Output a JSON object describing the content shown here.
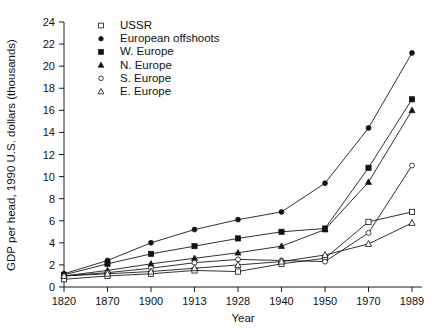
{
  "chart_data": {
    "type": "line",
    "title": "",
    "xlabel": "Year",
    "ylabel": "GDP per head, 1990 U.S. dollars (thousands)",
    "categories": [
      "1820",
      "1870",
      "1900",
      "1913",
      "1928",
      "1940",
      "1950",
      "1970",
      "1989"
    ],
    "x": [
      1820,
      1870,
      1900,
      1913,
      1928,
      1940,
      1950,
      1970,
      1989
    ],
    "xlim": [
      0,
      8
    ],
    "ylim": [
      0,
      24
    ],
    "yticks": [
      0,
      2,
      4,
      6,
      8,
      10,
      12,
      14,
      16,
      18,
      20,
      22,
      24
    ],
    "grid": false,
    "legend_position": "top-left-inside",
    "series": [
      {
        "name": "USSR",
        "marker": "open-square",
        "values": [
          0.7,
          1.0,
          1.2,
          1.5,
          1.4,
          2.1,
          2.6,
          5.9,
          6.8
        ]
      },
      {
        "name": "European offshoots",
        "marker": "filled-circle",
        "values": [
          1.2,
          2.4,
          4.0,
          5.2,
          6.1,
          6.8,
          9.4,
          14.4,
          21.2
        ]
      },
      {
        "name": "W. Europe",
        "marker": "filled-square",
        "values": [
          1.1,
          2.1,
          3.0,
          3.7,
          4.4,
          5.0,
          5.3,
          10.8,
          17.0
        ]
      },
      {
        "name": "N. Europe",
        "marker": "filled-triangle",
        "values": [
          1.0,
          1.5,
          2.1,
          2.6,
          3.1,
          3.7,
          5.2,
          9.5,
          16.0
        ]
      },
      {
        "name": "S. Europe",
        "marker": "open-circle",
        "values": [
          1.0,
          1.3,
          1.7,
          2.2,
          2.5,
          2.4,
          2.3,
          4.9,
          11.0
        ]
      },
      {
        "name": "E. Europe",
        "marker": "open-triangle",
        "values": [
          1.0,
          1.2,
          1.4,
          1.7,
          2.0,
          2.3,
          2.9,
          3.9,
          5.8
        ]
      }
    ]
  },
  "colors": {
    "ink": "#1a1a1a",
    "background": "#ffffff"
  }
}
